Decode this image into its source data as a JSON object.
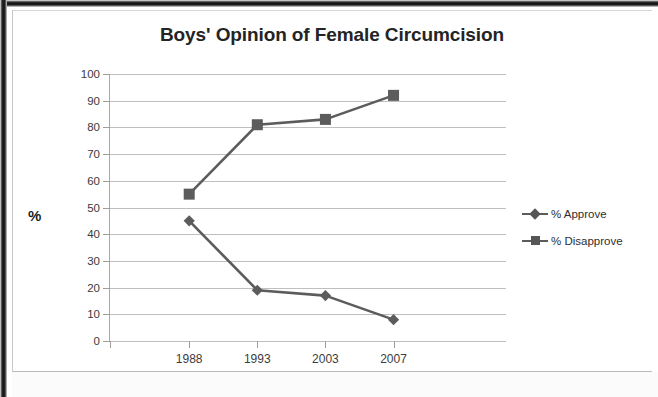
{
  "figure": {
    "frame_style": "scanned-page-border",
    "background_color": "#ffffff"
  },
  "chart_data": {
    "type": "line",
    "title": "Boys' Opinion of Female Circumcision",
    "xlabel": "",
    "ylabel": "%",
    "categories": [
      "1988",
      "1993",
      "2003",
      "2007"
    ],
    "series": [
      {
        "name": "% Approve",
        "marker": "diamond",
        "color": "#5c5c5c",
        "values": [
          45,
          19,
          17,
          8
        ]
      },
      {
        "name": "% Disapprove",
        "marker": "square",
        "color": "#5c5c5c",
        "values": [
          55,
          81,
          83,
          92
        ]
      }
    ],
    "ylim": [
      0,
      100
    ],
    "ytick_labels": [
      "100",
      "90",
      "80",
      "70",
      "60",
      "50",
      "40",
      "30",
      "20",
      "10",
      "0"
    ],
    "ytick_values": [
      100,
      90,
      80,
      70,
      60,
      50,
      40,
      30,
      20,
      10,
      0
    ],
    "grid": true,
    "grid_axis": "y",
    "grid_color": "#bfbfbf",
    "legend_position": "right"
  },
  "legend": {
    "items": [
      {
        "label": "% Approve",
        "marker": "diamond-marker"
      },
      {
        "label": "% Disapprove",
        "marker": "square-marker"
      }
    ]
  }
}
